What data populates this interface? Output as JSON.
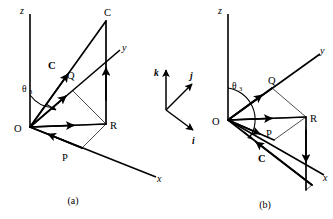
{
  "figure": {
    "caption_a": "(a)",
    "caption_b": "(b)",
    "stroke_color": "#000000",
    "background_color": "#ffffff"
  },
  "panel_a": {
    "axes": {
      "z": "z",
      "y": "y",
      "x": "x"
    },
    "origin_label": "O",
    "points": {
      "C": "C",
      "Q": "Q",
      "R": "R",
      "P": "P"
    },
    "vector_label": "C",
    "angle": {
      "symbol": "θ",
      "subscript": "3"
    }
  },
  "panel_b": {
    "axes": {
      "z": "z",
      "y": "y",
      "x": "x"
    },
    "origin_label": "O",
    "points": {
      "Q": "Q",
      "R": "R",
      "P": "P"
    },
    "vector_label": "C",
    "angle": {
      "symbol": "θ",
      "subscript": "3"
    }
  },
  "basis_triad": {
    "k": "k",
    "j": "j",
    "i": "i"
  }
}
